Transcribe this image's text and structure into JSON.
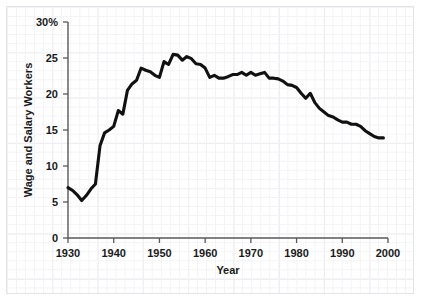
{
  "chart_data": {
    "type": "line",
    "title": "",
    "xlabel": "Year",
    "ylabel": "Wage and Salary Workers",
    "xlim": [
      1930,
      2000
    ],
    "ylim": [
      0,
      30
    ],
    "grid": true,
    "legend": "none",
    "y_unit_suffix": "%",
    "xticks": [
      1930,
      1940,
      1950,
      1960,
      1970,
      1980,
      1990,
      2000
    ],
    "xtick_labels": [
      "1930",
      "1940",
      "1950",
      "1960",
      "1970",
      "1980",
      "1990",
      "2000"
    ],
    "yticks": [
      0,
      5,
      10,
      15,
      20,
      25,
      30
    ],
    "ytick_labels": [
      "0",
      "5",
      "10",
      "15",
      "20",
      "25",
      "30%"
    ],
    "series": [
      {
        "name": "Union membership as percent of wage and salary workers",
        "color": "#111111",
        "x": [
          1930,
          1931,
          1932,
          1933,
          1934,
          1935,
          1936,
          1937,
          1938,
          1939,
          1940,
          1941,
          1942,
          1943,
          1944,
          1945,
          1946,
          1947,
          1948,
          1949,
          1950,
          1951,
          1952,
          1953,
          1954,
          1955,
          1956,
          1957,
          1958,
          1959,
          1960,
          1961,
          1962,
          1963,
          1964,
          1965,
          1966,
          1967,
          1968,
          1969,
          1970,
          1971,
          1972,
          1973,
          1974,
          1975,
          1976,
          1977,
          1978,
          1979,
          1980,
          1981,
          1982,
          1983,
          1984,
          1985,
          1986,
          1987,
          1988,
          1989,
          1990,
          1991,
          1992,
          1993,
          1994,
          1995,
          1996,
          1997,
          1998,
          1999
        ],
        "values": [
          7.0,
          6.6,
          6.0,
          5.2,
          5.9,
          6.8,
          7.5,
          12.8,
          14.6,
          15.0,
          15.5,
          17.7,
          17.2,
          20.5,
          21.4,
          21.9,
          23.6,
          23.3,
          23.1,
          22.6,
          22.3,
          24.5,
          24.1,
          25.5,
          25.4,
          24.7,
          25.2,
          24.9,
          24.2,
          24.1,
          23.6,
          22.3,
          22.6,
          22.2,
          22.2,
          22.4,
          22.7,
          22.7,
          23.0,
          22.6,
          23.0,
          22.6,
          22.8,
          23.0,
          22.2,
          22.2,
          22.1,
          21.8,
          21.3,
          21.2,
          20.9,
          20.1,
          19.4,
          20.1,
          18.8,
          18.0,
          17.5,
          17.0,
          16.8,
          16.4,
          16.1,
          16.1,
          15.8,
          15.8,
          15.5,
          14.9,
          14.5,
          14.1,
          13.9,
          13.9
        ]
      }
    ]
  },
  "axis": {
    "ylabel_text": "Wage and Salary Workers",
    "xlabel_text": "Year"
  }
}
